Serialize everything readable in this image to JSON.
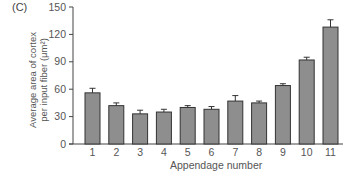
{
  "panel_label": "(C)",
  "chart_data": {
    "type": "bar",
    "title": "",
    "xlabel": "Appendage number",
    "ylabel": "Average area of cortex per input fiber (μm²)",
    "ylabel_lines": [
      "Average area of cortex",
      "per input fiber (μm²)"
    ],
    "categories": [
      "1",
      "2",
      "3",
      "4",
      "5",
      "6",
      "7",
      "8",
      "9",
      "10",
      "11"
    ],
    "values": [
      56,
      42,
      33,
      35,
      40,
      38,
      47,
      45,
      64,
      92,
      128
    ],
    "error_upper": [
      61,
      45,
      37,
      38,
      42,
      41,
      53,
      47,
      66,
      95,
      136
    ],
    "ylim": [
      0,
      150
    ],
    "yticks": [
      0,
      30,
      60,
      90,
      120,
      150
    ],
    "grid": false,
    "legend": null,
    "colors": {
      "bar_fill": "#8e8e8e",
      "bar_edge": "#333333",
      "axis": "#444444"
    }
  }
}
